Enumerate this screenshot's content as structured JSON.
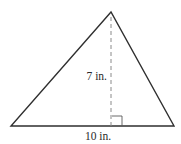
{
  "figure": {
    "type": "triangle-area-diagram",
    "shape": "triangle",
    "colors": {
      "stroke": "#2f2f2f",
      "dashed": "#8a8a8a",
      "background": "#ffffff",
      "text": "#2a2a2a"
    },
    "vertices": {
      "apex": [
        111,
        12
      ],
      "base_left": [
        11,
        126
      ],
      "base_right": [
        174,
        126
      ]
    },
    "height": {
      "label": "7 in.",
      "value": 7,
      "unit": "in.",
      "line_style": "dashed"
    },
    "base": {
      "label": "10 in.",
      "value": 10,
      "unit": "in."
    },
    "right_angle_marker": true
  }
}
